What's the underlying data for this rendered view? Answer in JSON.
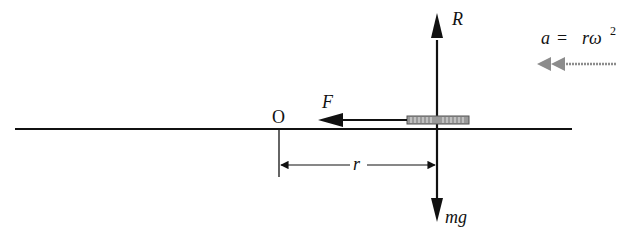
{
  "diagram": {
    "labels": {
      "origin": "O",
      "reaction": "R",
      "weight": "mg",
      "friction": "F",
      "radius": "r",
      "acceleration_lhs": "a",
      "acceleration_eq": "=",
      "acceleration_rhs": "rω",
      "acceleration_exp": "2"
    },
    "colors": {
      "ink": "#111111",
      "bead": "#8a8a8a",
      "accel_arrow": "#8c8c8c"
    }
  }
}
